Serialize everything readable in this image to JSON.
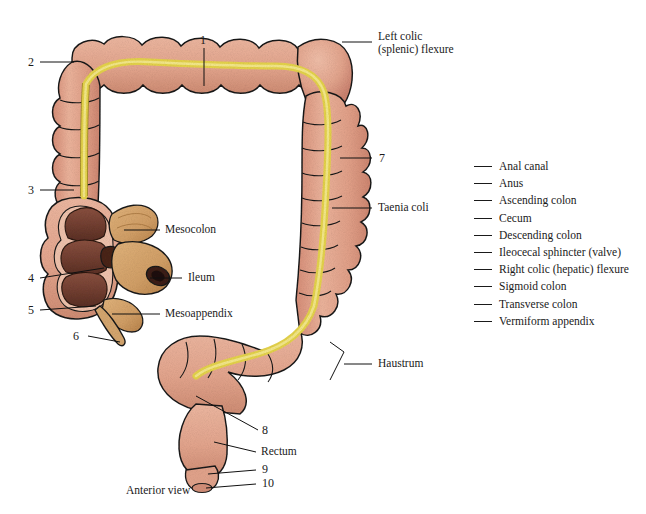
{
  "figure": {
    "caption": "Anterior view",
    "background_color": "#ffffff",
    "colors": {
      "colon_wall": "#e8a78f",
      "colon_shadow": "#d08d74",
      "taenia_coli": "#e6d44b",
      "taenia_shadow": "#c9b52f",
      "mucosa": "#7d4636",
      "mucosa_dark": "#5e3226",
      "mesentery": "#d9a76d",
      "mesentery_shadow": "#bb8749",
      "outline": "#1a1a1a",
      "text": "#1a1a1a"
    }
  },
  "named_labels": [
    {
      "id": "left-colic-flexure",
      "line1": "Left colic",
      "line2": "(splenic) flexure"
    },
    {
      "id": "taenia-coli",
      "line1": "Taenia coli",
      "line2": ""
    },
    {
      "id": "mesocolon",
      "line1": "Mesocolon",
      "line2": ""
    },
    {
      "id": "ileum",
      "line1": "Ileum",
      "line2": ""
    },
    {
      "id": "mesoappendix",
      "line1": "Mesoappendix",
      "line2": ""
    },
    {
      "id": "haustrum",
      "line1": "Haustrum",
      "line2": ""
    },
    {
      "id": "rectum",
      "line1": "Rectum",
      "line2": ""
    }
  ],
  "numbered_callouts": [
    {
      "number": "1"
    },
    {
      "number": "2"
    },
    {
      "number": "3"
    },
    {
      "number": "4"
    },
    {
      "number": "5"
    },
    {
      "number": "6"
    },
    {
      "number": "7"
    },
    {
      "number": "8"
    },
    {
      "number": "9"
    },
    {
      "number": "10"
    }
  ],
  "word_list": [
    {
      "term": "Anal canal"
    },
    {
      "term": "Anus"
    },
    {
      "term": "Ascending colon"
    },
    {
      "term": "Cecum"
    },
    {
      "term": "Descending colon"
    },
    {
      "term": "Ileocecal sphincter (valve)"
    },
    {
      "term": "Right colic (hepatic) flexure"
    },
    {
      "term": "Sigmoid colon"
    },
    {
      "term": "Transverse colon"
    },
    {
      "term": "Vermiform appendix"
    }
  ]
}
